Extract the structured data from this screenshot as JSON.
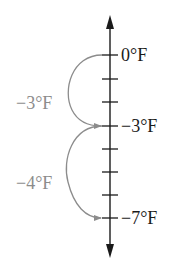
{
  "diagram": {
    "type": "vertical-number-line",
    "axis": {
      "x": 110,
      "top_arrow_y": 15,
      "bottom_arrow_y": 258,
      "color": "#1a1a1a"
    },
    "ticks_y": [
      55,
      79,
      102,
      126,
      149,
      172,
      195,
      218
    ],
    "marked_values": [
      {
        "label": "0°F",
        "tick_index": 0
      },
      {
        "label": "−3°F",
        "tick_index": 3
      },
      {
        "label": "−7°F",
        "tick_index": 7
      }
    ],
    "jumps": [
      {
        "label": "−3°F",
        "from_tick": 0,
        "to_tick": 3,
        "color": "#8c8c8c"
      },
      {
        "label": "−4°F",
        "from_tick": 3,
        "to_tick": 7,
        "color": "#8c8c8c"
      }
    ]
  }
}
